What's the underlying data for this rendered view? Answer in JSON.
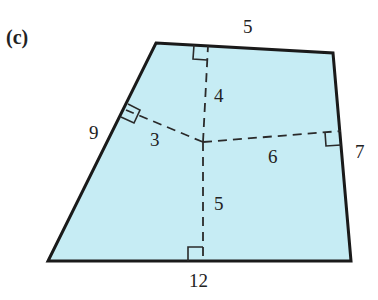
{
  "figure": {
    "part_label": "(c)",
    "fill_color": "#c6ecf4",
    "stroke_color": "#1a1a1a",
    "shape": "quadrilateral",
    "side_lengths": {
      "top": "5",
      "right": "7",
      "bottom": "12",
      "left": "9"
    },
    "perpendicular_distances": {
      "to_top": "4",
      "to_left": "3",
      "to_right": "6",
      "to_bottom": "5"
    }
  }
}
